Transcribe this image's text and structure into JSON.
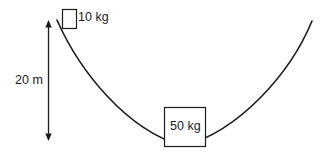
{
  "figure": {
    "background_color": "#ffffff",
    "stroke_color": "#1b1b1b",
    "text_color": "#1b1b1b"
  },
  "dimension": {
    "name": "height-dimension",
    "label": "20 m",
    "value": 20,
    "unit": "m",
    "orientation": "vertical",
    "arrowheads": "both"
  },
  "blocks": [
    {
      "name": "small-block",
      "label": "10 kg",
      "mass": 10,
      "unit": "kg",
      "position": "top-left-rim"
    },
    {
      "name": "large-block",
      "label": "50 kg",
      "mass": 50,
      "unit": "kg",
      "position": "bottom-center"
    }
  ],
  "curve": {
    "name": "bowl-curve",
    "shape": "parabola",
    "left_end": [
      57,
      20
    ],
    "vertex": [
      183,
      146
    ],
    "right_end": [
      312,
      21
    ]
  }
}
